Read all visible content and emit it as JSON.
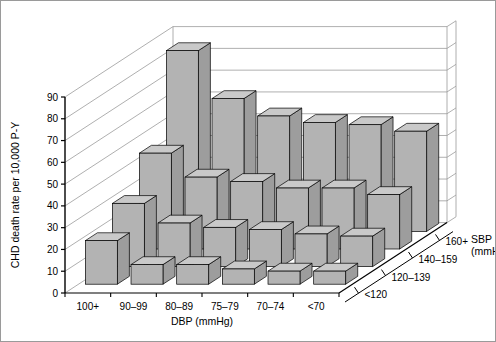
{
  "chart_data": {
    "type": "bar",
    "render": "3d-grouped-bar",
    "title": "",
    "subtitle": "",
    "xlabel": "DBP (mmHg)",
    "ylabel": "CHD death rate per 10,000 P-Y",
    "zlabel": "SBP (mmHg)",
    "categories": [
      "100+",
      "90–99",
      "80–89",
      "75–79",
      "70–74",
      "<70"
    ],
    "z_categories": [
      "<120",
      "120–139",
      "140–159",
      "160+"
    ],
    "ylim": [
      0,
      90
    ],
    "yticks": [
      0,
      10,
      20,
      30,
      40,
      50,
      60,
      70,
      80,
      90
    ],
    "ytick_labels": [
      "0",
      "10",
      "20",
      "30",
      "40",
      "50",
      "60",
      "70",
      "80",
      "90"
    ],
    "grid": true,
    "legend": "none",
    "series": [
      {
        "name": "<120",
        "values": [
          20,
          9,
          9,
          7,
          6,
          6
        ]
      },
      {
        "name": "120–139",
        "values": [
          29,
          20,
          18,
          17,
          15,
          14
        ]
      },
      {
        "name": "140–159",
        "values": [
          44,
          33,
          31,
          28,
          28,
          25
        ]
      },
      {
        "name": "160+",
        "values": [
          83,
          61,
          53,
          50,
          49,
          46
        ]
      }
    ],
    "annotations": []
  },
  "axes": {
    "y_title": "CHD death rate per 10,000 P-Y",
    "x_title": "DBP (mmHg)",
    "z_title_line1": "SBP",
    "z_title_line2": "(mmHg)"
  },
  "style": {
    "bar_front": "#b3b3b3",
    "bar_top": "#c9c9c9",
    "bar_side": "#9d9d9d",
    "grid_color": "#9a9a9a",
    "axis_color": "#000000",
    "frame_color": "#9a9a9a",
    "background": "#ffffff"
  }
}
